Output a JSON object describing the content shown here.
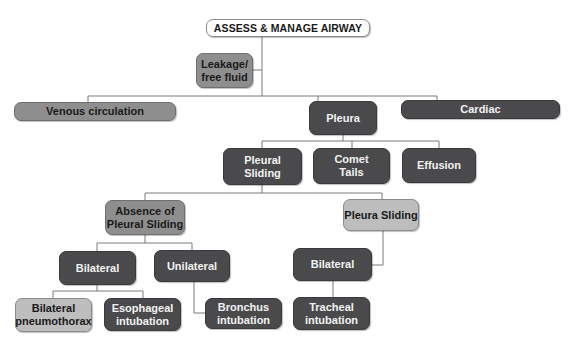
{
  "diagram": {
    "title": "ASSESS & MANAGE AIRWAY",
    "colors": {
      "root_fill": "#ffffff",
      "mid_gray": "#8e8e8e",
      "dark_gray": "#4a4a4c",
      "light_gray": "#bdbdbd",
      "connector": "#7a7a7a"
    },
    "nodes": {
      "root": "ASSESS & MANAGE AIRWAY",
      "leakage": "Leakage/\nfree fluid",
      "venous": "Venous circulation",
      "pleura": "Pleura",
      "cardiac": "Cardiac",
      "pleural_sliding": "Pleural\nSliding",
      "comet_tails": "Comet\nTails",
      "effusion": "Effusion",
      "absence": "Absence of\nPleural Sliding",
      "pleura_sliding": "Pleura Sliding",
      "bilateral_left": "Bilateral",
      "unilateral": "Unilateral",
      "bilateral_right": "Bilateral",
      "bilateral_pneumothorax": "Bilateral\npneumothorax",
      "esophageal": "Esophageal\nintubation",
      "bronchus": "Bronchus\nintubation",
      "tracheal": "Tracheal\nintubation"
    },
    "edges": [
      [
        "root",
        "leakage"
      ],
      [
        "root",
        "venous"
      ],
      [
        "root",
        "pleura"
      ],
      [
        "root",
        "cardiac"
      ],
      [
        "pleura",
        "pleural_sliding"
      ],
      [
        "pleura",
        "comet_tails"
      ],
      [
        "pleura",
        "effusion"
      ],
      [
        "pleural_sliding",
        "absence"
      ],
      [
        "pleural_sliding",
        "pleura_sliding"
      ],
      [
        "absence",
        "bilateral_left"
      ],
      [
        "absence",
        "unilateral"
      ],
      [
        "bilateral_left",
        "bilateral_pneumothorax"
      ],
      [
        "bilateral_left",
        "esophageal"
      ],
      [
        "unilateral",
        "bronchus"
      ],
      [
        "pleura_sliding",
        "bilateral_right"
      ],
      [
        "bilateral_right",
        "tracheal"
      ]
    ]
  }
}
